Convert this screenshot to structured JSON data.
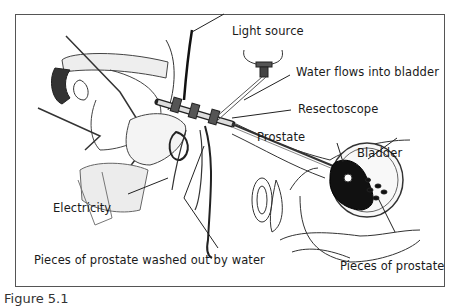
{
  "diagram": {
    "labels": {
      "light_source": "Light source",
      "water_flows": "Water flows into bladder",
      "resectoscope": "Resectoscope",
      "prostate": "Prostate",
      "bladder": "Bladder",
      "electricity": "Electricity",
      "pieces_washed": "Pieces of prostate washed out by water",
      "pieces_prostate": "Pieces of prostate"
    },
    "caption": "Figure 5.1"
  }
}
